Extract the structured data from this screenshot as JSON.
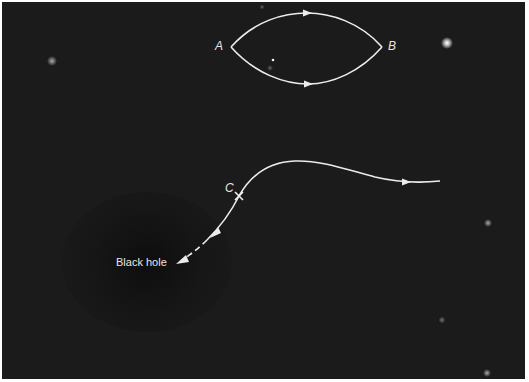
{
  "diagram": {
    "background_color": "#1b1b1b",
    "line_color": "#ececec",
    "labels": {
      "a": "A",
      "b": "B",
      "c": "C",
      "black_hole": "Black hole"
    },
    "paths": [
      {
        "name": "upper-path-a-to-b",
        "from": "A",
        "to": "B",
        "direction": "right"
      },
      {
        "name": "lower-path-a-to-b",
        "from": "A",
        "to": "B",
        "direction": "right"
      },
      {
        "name": "light-ray-through-c",
        "through": "C",
        "ends_at": "Black hole",
        "final_segment": "dashed"
      }
    ],
    "stars": [
      {
        "x": 447,
        "y": 43,
        "brightness": "bright"
      },
      {
        "x": 52,
        "y": 61,
        "brightness": "dim"
      },
      {
        "x": 488,
        "y": 223,
        "brightness": "dim"
      },
      {
        "x": 442,
        "y": 320,
        "brightness": "faint"
      },
      {
        "x": 487,
        "y": 373,
        "brightness": "dim"
      }
    ]
  }
}
